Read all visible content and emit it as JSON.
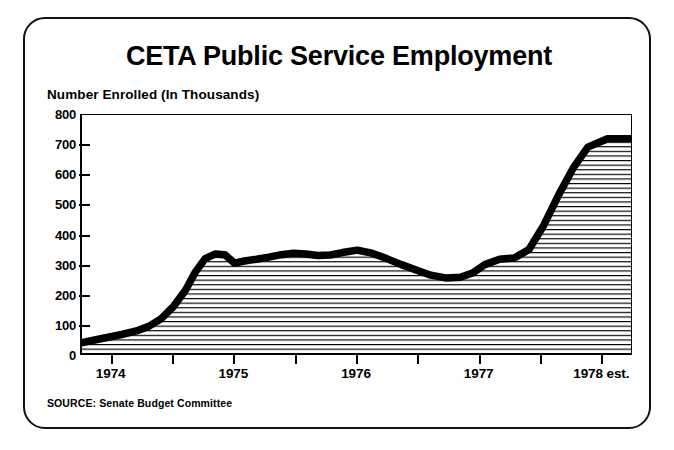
{
  "chart_data": {
    "type": "area",
    "title": "CETA Public Service Employment",
    "subtitle": "Number Enrolled (In Thousands)",
    "ylabel": "Number Enrolled (In Thousands)",
    "xlabel": "",
    "ylim": [
      0,
      800
    ],
    "yticks": [
      800,
      700,
      600,
      500,
      400,
      300,
      200,
      100,
      0
    ],
    "ytick_labels": [
      "800",
      "700",
      "600",
      "500",
      "400",
      "300",
      "200",
      "100",
      "0"
    ],
    "xtick_labels": [
      "1974",
      "1975",
      "1976",
      "1977",
      "1978 est."
    ],
    "xlim": [
      1974.0,
      1978.5
    ],
    "grid": false,
    "legend": null,
    "source": "SOURCE: Senate Budget Committee",
    "series": [
      {
        "name": "Number Enrolled (Thousands)",
        "x": [
          1974.0,
          1974.1,
          1974.22,
          1974.34,
          1974.46,
          1974.56,
          1974.66,
          1974.76,
          1974.86,
          1974.94,
          1975.02,
          1975.1,
          1975.18,
          1975.26,
          1975.34,
          1975.44,
          1975.54,
          1975.64,
          1975.74,
          1975.84,
          1975.94,
          1976.04,
          1976.14,
          1976.26,
          1976.38,
          1976.5,
          1976.62,
          1976.74,
          1976.86,
          1976.98,
          1977.1,
          1977.2,
          1977.3,
          1977.42,
          1977.54,
          1977.66,
          1977.78,
          1977.9,
          1978.02,
          1978.14,
          1978.3,
          1978.5
        ],
        "values": [
          40,
          48,
          58,
          68,
          80,
          95,
          120,
          160,
          215,
          275,
          320,
          335,
          333,
          305,
          312,
          318,
          325,
          333,
          338,
          335,
          330,
          332,
          340,
          348,
          338,
          320,
          300,
          282,
          265,
          256,
          258,
          272,
          300,
          318,
          322,
          350,
          430,
          530,
          620,
          690,
          718,
          718
        ]
      }
    ]
  },
  "page": {
    "title": "CETA Public Service Employment",
    "subtitle": "Number Enrolled (In Thousands)",
    "source": "SOURCE: Senate Budget Committee"
  }
}
